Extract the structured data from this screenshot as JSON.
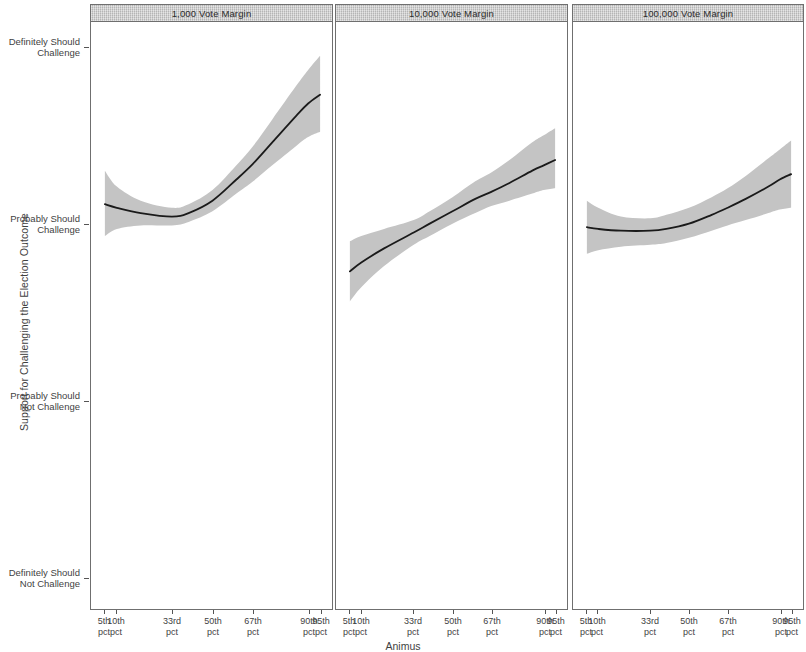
{
  "chart_data": {
    "type": "line",
    "title": "",
    "xlabel": "Animus",
    "ylabel": "Support for Challenging the Election Outcome",
    "grid": false,
    "legend": "none",
    "facet_variable": "Vote Margin",
    "band_label": "95% confidence interval",
    "y_tick_labels": [
      "Definitely Should\nChallenge",
      "Probably Should\nChallenge",
      "Probably Should\nNot Challenge",
      "Definitely Should\nNot Challenge"
    ],
    "y_tick_values": [
      4,
      3,
      2,
      1
    ],
    "ylim": [
      1,
      4
    ],
    "x_tick_labels": [
      "5th\npct",
      "10th\npct",
      "33rd\npct",
      "50th\npct",
      "67th\npct",
      "90th\npct",
      "95th\npct"
    ],
    "x_tick_values": [
      5,
      10,
      33,
      50,
      67,
      90,
      95
    ],
    "xlim": [
      5,
      95
    ],
    "line_color": "#1a1a1a",
    "band_color": "#c4c4c4",
    "panel_header_color": "#c9c9c9",
    "panels": [
      {
        "title": "1,000 Vote Margin",
        "x": [
          5,
          10,
          20,
          33,
          40,
          50,
          60,
          67,
          75,
          85,
          90,
          95
        ],
        "fit": [
          3.11,
          3.09,
          3.06,
          3.04,
          3.06,
          3.13,
          3.25,
          3.34,
          3.46,
          3.61,
          3.68,
          3.73
        ],
        "lower": [
          2.93,
          2.97,
          2.99,
          2.99,
          3.01,
          3.07,
          3.17,
          3.24,
          3.33,
          3.44,
          3.49,
          3.52
        ],
        "upper": [
          3.3,
          3.21,
          3.13,
          3.09,
          3.11,
          3.19,
          3.33,
          3.44,
          3.59,
          3.78,
          3.87,
          3.95
        ]
      },
      {
        "title": "10,000 Vote Margin",
        "x": [
          5,
          10,
          20,
          33,
          40,
          50,
          60,
          67,
          75,
          85,
          90,
          95
        ],
        "fit": [
          2.73,
          2.78,
          2.86,
          2.95,
          3.0,
          3.07,
          3.14,
          3.18,
          3.23,
          3.3,
          3.33,
          3.36
        ],
        "lower": [
          2.56,
          2.64,
          2.76,
          2.88,
          2.93,
          3.0,
          3.06,
          3.1,
          3.13,
          3.17,
          3.19,
          3.2
        ],
        "upper": [
          2.9,
          2.93,
          2.97,
          3.02,
          3.07,
          3.15,
          3.24,
          3.29,
          3.36,
          3.46,
          3.5,
          3.54
        ]
      },
      {
        "title": "100,000 Vote Margin",
        "x": [
          5,
          10,
          20,
          33,
          40,
          50,
          60,
          67,
          75,
          85,
          90,
          95
        ],
        "fit": [
          2.98,
          2.97,
          2.96,
          2.96,
          2.97,
          3.0,
          3.05,
          3.09,
          3.14,
          3.21,
          3.25,
          3.28
        ],
        "lower": [
          2.83,
          2.85,
          2.87,
          2.88,
          2.89,
          2.92,
          2.96,
          2.99,
          3.02,
          3.06,
          3.08,
          3.09
        ],
        "upper": [
          3.13,
          3.09,
          3.04,
          3.03,
          3.05,
          3.09,
          3.15,
          3.2,
          3.27,
          3.37,
          3.42,
          3.47
        ]
      }
    ]
  },
  "axis": {
    "y_title": "Support for Challenging the Election Outcome",
    "x_title": "Animus",
    "y_ticks": [
      {
        "line1": "Definitely Should",
        "line2": "Challenge"
      },
      {
        "line1": "Probably Should",
        "line2": "Challenge"
      },
      {
        "line1": "Probably Should",
        "line2": "Not Challenge"
      },
      {
        "line1": "Definitely Should",
        "line2": "Not Challenge"
      }
    ],
    "x_ticks": [
      {
        "line1": "5th",
        "line2": "pct"
      },
      {
        "line1": "10th",
        "line2": "pct"
      },
      {
        "line1": "33rd",
        "line2": "pct"
      },
      {
        "line1": "50th",
        "line2": "pct"
      },
      {
        "line1": "67th",
        "line2": "pct"
      },
      {
        "line1": "90th",
        "line2": "pct"
      },
      {
        "line1": "95th",
        "line2": "pct"
      }
    ]
  },
  "panel_titles": {
    "p0": "1,000 Vote Margin",
    "p1": "10,000 Vote Margin",
    "p2": "100,000 Vote Margin"
  }
}
